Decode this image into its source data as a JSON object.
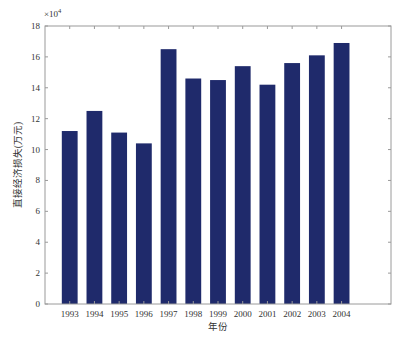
{
  "chart_data": {
    "type": "bar",
    "title": "",
    "xlabel": "年份",
    "ylabel": "直接经济损失(万元)",
    "y_multiplier_label": "×10⁴",
    "categories": [
      "1993",
      "1994",
      "1995",
      "1996",
      "1997",
      "1998",
      "1999",
      "2000",
      "2001",
      "2002",
      "2003",
      "2004"
    ],
    "values": [
      11.2,
      12.5,
      11.1,
      10.4,
      16.5,
      14.6,
      14.5,
      15.4,
      14.2,
      15.6,
      16.1,
      16.9
    ],
    "values_scaled_note": "values in units of 10^4 万元",
    "ylim": [
      0,
      18
    ],
    "yticks": [
      0,
      2,
      4,
      6,
      8,
      10,
      12,
      14,
      16,
      18
    ],
    "xlim": [
      0,
      14
    ],
    "grid": false,
    "legend": null,
    "bar_color": "#1f2a6b"
  }
}
